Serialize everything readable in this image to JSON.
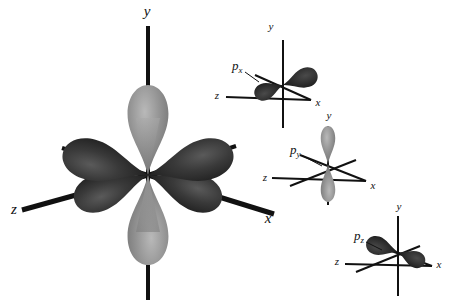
{
  "figure": {
    "background_color": "#ffffff",
    "colors": {
      "dark_lobe": "#2b2b2b",
      "light_lobe": "#8e8e8e",
      "axis": "#111111",
      "label": "#111111"
    }
  },
  "main_diagram": {
    "name": "combined-p-orbitals",
    "center": {
      "x": 148,
      "y": 175
    },
    "axis_labels": {
      "y": "y",
      "x": "x",
      "z": "z"
    },
    "axis_label_positions": {
      "y": {
        "x": 147,
        "y": 16
      },
      "x": {
        "x": 268,
        "y": 223
      },
      "z": {
        "x": 14,
        "y": 214
      }
    },
    "lobes": [
      {
        "name": "py-up",
        "color": "light",
        "direction": "up",
        "axis": "y"
      },
      {
        "name": "py-down",
        "color": "light",
        "direction": "down",
        "axis": "y"
      },
      {
        "name": "pz-back",
        "color": "dark",
        "direction": "upper-right",
        "axis": "z"
      },
      {
        "name": "px-back",
        "color": "dark",
        "direction": "upper-left",
        "axis": "x"
      },
      {
        "name": "pz-front",
        "color": "dark",
        "direction": "lower-left",
        "axis": "z"
      },
      {
        "name": "px-front",
        "color": "dark",
        "direction": "lower-right",
        "axis": "x"
      }
    ]
  },
  "small_diagrams": [
    {
      "id": "px",
      "label": "p",
      "subscript": "x",
      "label_position": {
        "x": 232,
        "y": 70
      },
      "center": {
        "x": 283,
        "y": 85
      },
      "lobe_color": "dark",
      "lobe_axis": "x",
      "axis_labels": {
        "y": "y",
        "x": "x",
        "z": "z"
      },
      "axis_label_positions": {
        "y": {
          "x": 271,
          "y": 30
        },
        "x": {
          "x": 316,
          "y": 106
        },
        "z": {
          "x": 217,
          "y": 99
        }
      }
    },
    {
      "id": "py",
      "label": "p",
      "subscript": "y",
      "label_position": {
        "x": 290,
        "y": 154
      },
      "center": {
        "x": 328,
        "y": 164
      },
      "lobe_color": "light",
      "lobe_axis": "y",
      "axis_labels": {
        "y": "y",
        "x": "x",
        "z": "z"
      },
      "axis_label_positions": {
        "y": {
          "x": 329,
          "y": 119
        },
        "x": {
          "x": 371,
          "y": 189
        },
        "z": {
          "x": 265,
          "y": 181
        }
      }
    },
    {
      "id": "pz",
      "label": "p",
      "subscript": "z",
      "label_position": {
        "x": 354,
        "y": 240
      },
      "center": {
        "x": 398,
        "y": 252
      },
      "lobe_color": "dark",
      "lobe_axis": "z",
      "axis_labels": {
        "y": "y",
        "x": "x",
        "z": "z"
      },
      "axis_label_positions": {
        "y": {
          "x": 399,
          "y": 210
        },
        "x": {
          "x": 437,
          "y": 268
        },
        "z": {
          "x": 337,
          "y": 265
        }
      }
    }
  ]
}
